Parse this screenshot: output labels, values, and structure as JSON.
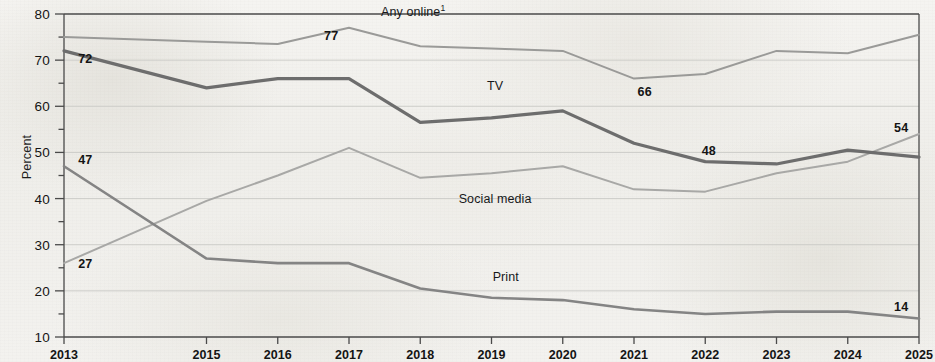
{
  "chart_data": {
    "type": "line",
    "title": "",
    "xlabel": "",
    "ylabel": "Percent",
    "ylim": [
      10,
      80
    ],
    "ytick_step": 10,
    "yminor_step": 5,
    "grid": true,
    "grid_axis": "y",
    "legend": "inline-labels",
    "x": [
      "2013",
      "2015",
      "2016",
      "2017",
      "2018",
      "2019",
      "2020",
      "2021",
      "2022",
      "2023",
      "2024",
      "2025"
    ],
    "categories": [
      "2013",
      "2015",
      "2016",
      "2017",
      "2018",
      "2019",
      "2020",
      "2021",
      "2022",
      "2023",
      "2024",
      "2025"
    ],
    "xtick_labels": [
      "2013",
      "2015",
      "2016",
      "2017",
      "2018",
      "2019",
      "2020",
      "2021",
      "2022",
      "2023",
      "2024",
      "2025"
    ],
    "series": [
      {
        "name": "Any online",
        "label": "Any online",
        "label_superscript": "1",
        "color": "#9a9a98",
        "width": 2.0,
        "values": [
          75,
          74,
          73.5,
          77,
          73,
          72.5,
          72,
          66,
          67,
          72,
          71.5,
          75.5
        ]
      },
      {
        "name": "TV",
        "label": "TV",
        "color": "#6d6d6d",
        "width": 3.2,
        "values": [
          72,
          64,
          66,
          66,
          56.5,
          57.5,
          59,
          52,
          48,
          47.5,
          50.5,
          49
        ]
      },
      {
        "name": "Social media",
        "label": "Social media",
        "color": "#a8a8a6",
        "width": 2.0,
        "values": [
          26,
          39.5,
          45,
          51,
          44.5,
          45.5,
          47,
          42,
          41.5,
          45.5,
          48,
          54
        ]
      },
      {
        "name": "Print",
        "label": "Print",
        "color": "#848484",
        "width": 2.6,
        "values": [
          47,
          27,
          26,
          26,
          20.5,
          18.5,
          18,
          16,
          15,
          15.5,
          15.5,
          14
        ]
      }
    ],
    "series_labels": [
      {
        "series": "Any online",
        "text": "Any online",
        "superscript": "1",
        "x": 2017.9,
        "y": 80.6
      },
      {
        "series": "TV",
        "text": "TV",
        "x": 2019.05,
        "y": 64.5
      },
      {
        "series": "Social media",
        "text": "Social media",
        "x": 2019.05,
        "y": 40.0
      },
      {
        "series": "Print",
        "text": "Print",
        "x": 2019.2,
        "y": 23.0
      }
    ],
    "data_labels": [
      {
        "series": "TV",
        "value": "72",
        "x": 2013.3,
        "y": 70.2
      },
      {
        "series": "Print",
        "value": "47",
        "x": 2013.3,
        "y": 48.4
      },
      {
        "series": "Social media",
        "value": "27",
        "x": 2013.3,
        "y": 25.8
      },
      {
        "series": "Any online",
        "value": "77",
        "x": 2016.75,
        "y": 75.2
      },
      {
        "series": "Any online",
        "value": "66",
        "x": 2021.15,
        "y": 63.0
      },
      {
        "series": "TV",
        "value": "48",
        "x": 2022.05,
        "y": 50.3
      },
      {
        "series": "Social media",
        "value": "54",
        "x": 2024.75,
        "y": 55.4
      },
      {
        "series": "Print",
        "value": "14",
        "x": 2024.75,
        "y": 16.4
      }
    ]
  }
}
